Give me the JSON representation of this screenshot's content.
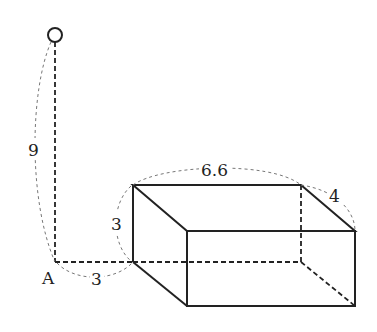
{
  "diagram": {
    "type": "geometry-figure",
    "labels": {
      "pole_height": "9",
      "point_a": "A",
      "distance_a_to_box": "3",
      "box_height": "3",
      "box_length": "6.6",
      "box_depth": "4"
    },
    "colors": {
      "line": "#222222",
      "dim_line": "#777777"
    }
  }
}
